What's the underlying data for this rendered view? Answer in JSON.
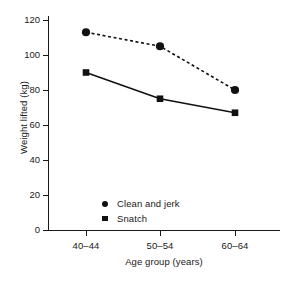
{
  "chart_data": {
    "type": "line",
    "title": "",
    "subtitle": "",
    "xlabel": "Age group (years)",
    "ylabel": "Weight lifted (kg)",
    "categories": [
      "40–44",
      "50–54",
      "60–64"
    ],
    "ylim": [
      0,
      120
    ],
    "ytick_labels": [
      "0",
      "20",
      "40",
      "60",
      "80",
      "100",
      "120"
    ],
    "ytick_values": [
      0,
      20,
      40,
      60,
      80,
      100,
      120
    ],
    "grid": false,
    "legend_position": "inside-lower-left",
    "series": [
      {
        "name": "Clean and jerk",
        "values": [
          113,
          105,
          80
        ],
        "marker": "circle",
        "linestyle": "dashed",
        "color": "#111111"
      },
      {
        "name": "Snatch",
        "values": [
          90,
          75,
          67
        ],
        "marker": "square",
        "linestyle": "solid",
        "color": "#111111"
      }
    ]
  },
  "legend": {
    "entries": [
      {
        "label": "Clean and jerk",
        "marker": "circle"
      },
      {
        "label": "Snatch",
        "marker": "square"
      }
    ]
  },
  "colors": {
    "ink": "#1a1a1a",
    "marker": "#111111",
    "background": "#ffffff"
  }
}
